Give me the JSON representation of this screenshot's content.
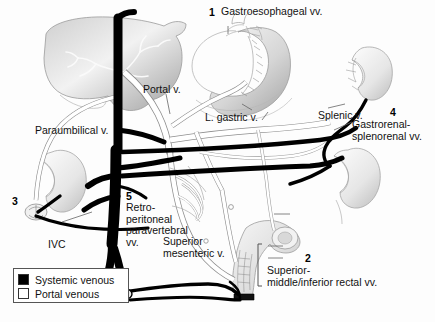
{
  "figure": {
    "background_color": "#fdfdfd",
    "systemic_color": "#000000",
    "portal_color": "#ffffff",
    "outline_color": "#555555"
  },
  "numbered_callouts": [
    {
      "number": "1",
      "label": "Gastroesophageal vv."
    },
    {
      "number": "2",
      "label": "Superior-\nmiddle/inferior rectal vv."
    },
    {
      "number": "3",
      "label": ""
    },
    {
      "number": "4",
      "label": "Gastrorenal-\nsplenorenal vv."
    },
    {
      "number": "5",
      "label": "Retro-\nperitoneal\nparavertebral\nvv."
    }
  ],
  "vessel_labels": [
    {
      "name": "portal-vein",
      "text": "Portal v."
    },
    {
      "name": "paraumbilical-vein",
      "text": "Paraumbilical v."
    },
    {
      "name": "left-gastric-vein",
      "text": "L. gastric v."
    },
    {
      "name": "splenic-vein",
      "text": "Splenic v."
    },
    {
      "name": "inferior-vena-cava",
      "text": "IVC"
    },
    {
      "name": "superior-mesenteric-vein",
      "text": "Superior\nmesenteric v."
    }
  ],
  "legend": {
    "items": [
      {
        "swatch": "filled-black-square",
        "label": "Systemic venous"
      },
      {
        "swatch": "open-white-square",
        "label": "Portal venous"
      }
    ]
  },
  "organs": [
    {
      "name": "liver"
    },
    {
      "name": "stomach"
    },
    {
      "name": "left-kidney"
    },
    {
      "name": "right-kidney"
    },
    {
      "name": "rectum"
    },
    {
      "name": "umbilicus"
    }
  ]
}
